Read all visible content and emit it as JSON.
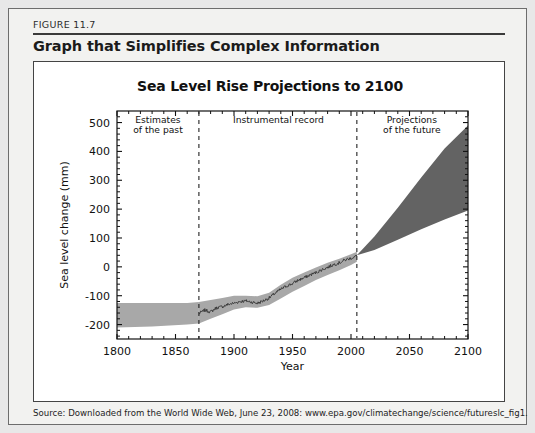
{
  "figure": {
    "number_label": "FIGURE 11.7",
    "caption": "Graph that Simplifies Complex Information",
    "source": "Source: Downloaded from the World Wide Web, June 23, 2008: www.epa.gov/climatechange/science/futureslc_fig1."
  },
  "colors": {
    "page_background": "#e8e8e8",
    "card_background": "#f2f2f0",
    "panel_background": "#ffffff",
    "uncertainty_band": "#a8a8a8",
    "projection_cone": "#636363",
    "record_line": "#3a3a3a",
    "axis": "#111111",
    "divider": "#222222"
  },
  "chart_data": {
    "type": "area",
    "title": "Sea Level Rise Projections to 2100",
    "xlabel": "Year",
    "ylabel": "Sea level change (mm)",
    "xlim": [
      1800,
      2100
    ],
    "ylim": [
      -250,
      540
    ],
    "xticks": [
      1800,
      1850,
      1900,
      1950,
      2000,
      2050,
      2100
    ],
    "yticks": [
      -200,
      -100,
      0,
      100,
      200,
      300,
      400,
      500
    ],
    "minor_ticks": true,
    "grid": false,
    "legend": "none",
    "annotations": [
      {
        "text": "Estimates of the past",
        "lines": [
          "Estimates",
          "of the past"
        ],
        "x_center": 1835,
        "y": 500
      },
      {
        "text": "Instrumental record",
        "lines": [
          "Instrumental record"
        ],
        "x_center": 1938,
        "y": 500
      },
      {
        "text": "Projections of the future",
        "lines": [
          "Projections",
          "of the future"
        ],
        "x_center": 2052,
        "y": 500
      }
    ],
    "dividers": [
      {
        "x": 1870,
        "style": "dashed"
      },
      {
        "x": 2005,
        "style": "dashed"
      }
    ],
    "series": [
      {
        "name": "Estimates of the past (uncertainty band)",
        "type": "band",
        "x": [
          1800,
          1830,
          1860,
          1870
        ],
        "upper": [
          -125,
          -125,
          -125,
          -122
        ],
        "lower": [
          -210,
          -207,
          -200,
          -196
        ]
      },
      {
        "name": "Instrumental record (uncertainty band)",
        "type": "band",
        "x": [
          1870,
          1880,
          1890,
          1900,
          1910,
          1920,
          1930,
          1940,
          1950,
          1960,
          1970,
          1980,
          1990,
          2000,
          2005
        ],
        "upper": [
          -122,
          -115,
          -108,
          -100,
          -100,
          -102,
          -90,
          -62,
          -38,
          -20,
          -2,
          14,
          28,
          44,
          52
        ],
        "lower": [
          -196,
          -180,
          -164,
          -148,
          -140,
          -142,
          -132,
          -110,
          -86,
          -66,
          -46,
          -28,
          -12,
          6,
          18
        ]
      },
      {
        "name": "Instrumental record (observed mean)",
        "type": "line",
        "x": [
          1870,
          1875,
          1880,
          1885,
          1890,
          1895,
          1900,
          1905,
          1910,
          1915,
          1920,
          1925,
          1930,
          1935,
          1940,
          1945,
          1950,
          1955,
          1960,
          1965,
          1970,
          1975,
          1980,
          1985,
          1990,
          1995,
          2000,
          2005
        ],
        "y": [
          -162,
          -150,
          -156,
          -142,
          -138,
          -130,
          -126,
          -120,
          -118,
          -122,
          -126,
          -118,
          -108,
          -92,
          -78,
          -66,
          -58,
          -46,
          -38,
          -28,
          -20,
          -10,
          -2,
          8,
          14,
          24,
          30,
          38
        ]
      },
      {
        "name": "Projections of the future (range)",
        "type": "band",
        "x": [
          2005,
          2020,
          2040,
          2060,
          2080,
          2100
        ],
        "upper": [
          40,
          105,
          205,
          310,
          410,
          490
        ],
        "lower": [
          40,
          58,
          94,
          130,
          164,
          195
        ]
      }
    ]
  }
}
